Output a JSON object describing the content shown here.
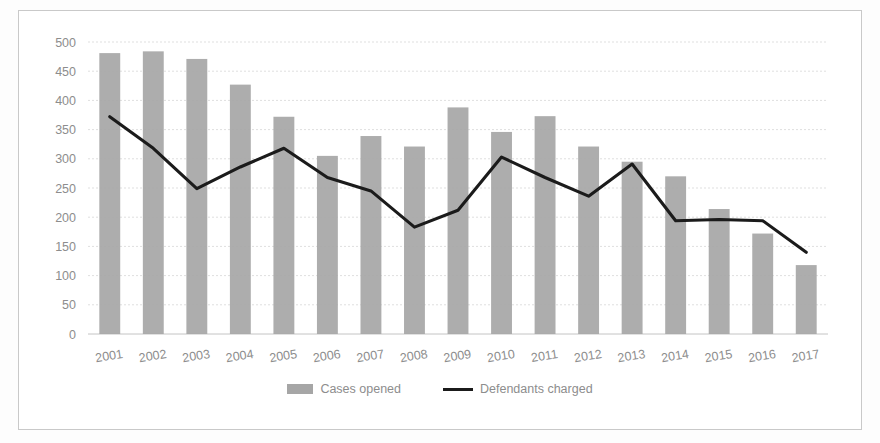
{
  "chart_data": {
    "type": "bar",
    "title": "",
    "subtitle": "",
    "xlabel": "",
    "ylabel": "",
    "ylim": [
      0,
      500
    ],
    "ytick_step": 50,
    "grid": true,
    "legend_position": "bottom",
    "categories": [
      "2001",
      "2002",
      "2003",
      "2004",
      "2005",
      "2006",
      "2007",
      "2008",
      "2009",
      "2010",
      "2011",
      "2012",
      "2013",
      "2014",
      "2015",
      "2016",
      "2017"
    ],
    "yticks": [
      "0",
      "50",
      "100",
      "150",
      "200",
      "250",
      "300",
      "350",
      "400",
      "450",
      "500"
    ],
    "series": [
      {
        "name": "Cases opened",
        "type": "bar",
        "color": "#a6a6a6",
        "values": [
          481,
          484,
          471,
          427,
          372,
          305,
          339,
          321,
          388,
          346,
          373,
          321,
          295,
          270,
          214,
          172,
          118
        ]
      },
      {
        "name": "Defendants charged",
        "type": "line",
        "color": "#1b1b1b",
        "values": [
          372,
          318,
          249,
          286,
          318,
          268,
          245,
          183,
          212,
          303,
          268,
          236,
          291,
          194,
          196,
          194,
          140
        ]
      }
    ]
  },
  "legend": {
    "items": [
      {
        "label": "Cases opened",
        "swatch": "bar-swatch"
      },
      {
        "label": "Defendants charged",
        "swatch": "line-swatch"
      }
    ]
  }
}
